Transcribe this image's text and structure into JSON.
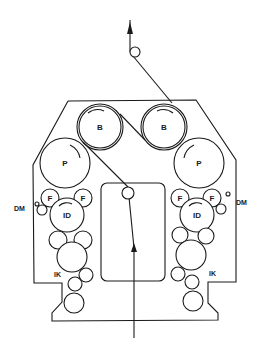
{
  "diagram": {
    "type": "printing press cross-section (blanket-to-blanket perfecting unit)",
    "labels": {
      "blanket": "B",
      "plate": "P",
      "form_roller": "F",
      "ink_distributor": "ID",
      "dampening": "DM",
      "inking": "IK"
    },
    "colors": {
      "line": "#1a1a1a",
      "background": "#ffffff"
    }
  }
}
